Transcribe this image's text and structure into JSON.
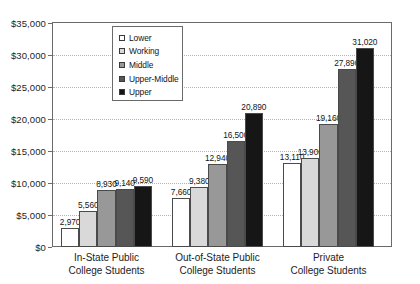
{
  "chart_data": {
    "type": "bar",
    "title": "",
    "subtitle": "",
    "xlabel": "",
    "ylabel": "",
    "categories": [
      "In-State Public\nCollege Students",
      "Out-of-State Public\nCollege Students",
      "Private\nCollege Students"
    ],
    "series": [
      {
        "name": "Lower",
        "color": "#ffffff",
        "values": [
          2970,
          7660,
          13110
        ]
      },
      {
        "name": "Working",
        "color": "#d9d9d9",
        "values": [
          5560,
          9380,
          13900
        ]
      },
      {
        "name": "Middle",
        "color": "#989898",
        "values": [
          8930,
          12940,
          19160
        ]
      },
      {
        "name": "Upper-Middle",
        "color": "#565656",
        "values": [
          9140,
          16500,
          27890
        ]
      },
      {
        "name": "Upper",
        "color": "#161616",
        "values": [
          9590,
          20890,
          31020
        ]
      }
    ],
    "value_labels": [
      [
        "2,970",
        "5,560",
        "8,930",
        "9,140",
        "9,590"
      ],
      [
        "7,660",
        "9,380",
        "12,940",
        "16,500",
        "20,890"
      ],
      [
        "13,110",
        "13,900",
        "19,160",
        "27,890",
        "31,020"
      ]
    ],
    "ylim": [
      0,
      35000
    ],
    "ytick_values": [
      0,
      5000,
      10000,
      15000,
      20000,
      25000,
      30000,
      35000
    ],
    "ytick_labels": [
      "$0",
      "$5,000",
      "$10,000",
      "$15,000",
      "$20,000",
      "$25,000",
      "$30,000",
      "$35,000"
    ],
    "grid": true,
    "legend_position": "top-left-inside",
    "legend_entries": [
      "Lower",
      "Working",
      "Middle",
      "Upper-Middle",
      "Upper"
    ]
  }
}
